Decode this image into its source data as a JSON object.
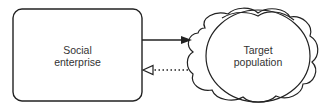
{
  "diagram": {
    "nodes": [
      {
        "id": "social-enterprise",
        "shape": "rounded-rectangle",
        "label_line1": "Social",
        "label_line2": "enterprise"
      },
      {
        "id": "target-population",
        "shape": "cloud",
        "label_line1": "Target",
        "label_line2": "population"
      }
    ],
    "edges": [
      {
        "from": "social-enterprise",
        "to": "target-population",
        "style": "solid",
        "arrowhead": "filled"
      },
      {
        "from": "target-population",
        "to": "social-enterprise",
        "style": "dotted",
        "arrowhead": "hollow"
      }
    ],
    "colors": {
      "stroke": "#222222",
      "text": "#333333",
      "background": "#ffffff"
    }
  }
}
